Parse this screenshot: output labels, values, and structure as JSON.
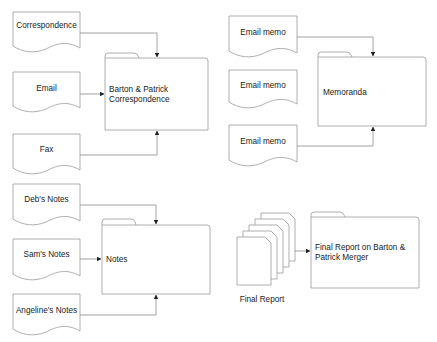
{
  "colors": {
    "shape_stroke": "#9a9a9a",
    "connector": "#8a8a8a",
    "arrowhead": "#222222",
    "text": "#1a1a1a",
    "background": "#ffffff"
  },
  "groups": [
    {
      "name": "correspondence-group",
      "documents": [
        {
          "label": "Correspondence"
        },
        {
          "label": "Email"
        },
        {
          "label": "Fax"
        }
      ],
      "folder": {
        "line1": "Barton & Patrick",
        "line2": "Correspondence"
      }
    },
    {
      "name": "memoranda-group",
      "documents": [
        {
          "label": "Email memo"
        },
        {
          "label": "Email memo"
        },
        {
          "label": "Email memo"
        }
      ],
      "folder": {
        "line1": "Memoranda"
      }
    },
    {
      "name": "notes-group",
      "documents": [
        {
          "label": "Deb's Notes"
        },
        {
          "label": "Sam's Notes"
        },
        {
          "label": "Angeline's Notes"
        }
      ],
      "folder": {
        "line1": "Notes"
      }
    },
    {
      "name": "final-report-group",
      "multi_document": {
        "label": "Final Report",
        "page_count": 5
      },
      "folder": {
        "line1": "Final Report on Barton &",
        "line2": "Patrick Merger"
      }
    }
  ]
}
